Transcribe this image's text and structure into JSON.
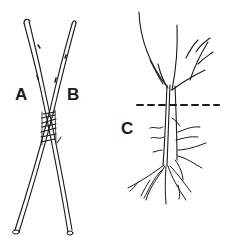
{
  "figure": {
    "labels": {
      "a": "A",
      "b": "B",
      "c": "C"
    },
    "panels": [
      {
        "id": "left",
        "description": "Two forked sticks A and B crossed and bound together with a wrapped tie near the middle"
      },
      {
        "id": "right",
        "description": "Rooted cutting / sapling with branches above and roots below a dashed soil line, labeled C"
      }
    ],
    "colors": {
      "ink": "#1a1a1a",
      "background": "#ffffff"
    }
  }
}
